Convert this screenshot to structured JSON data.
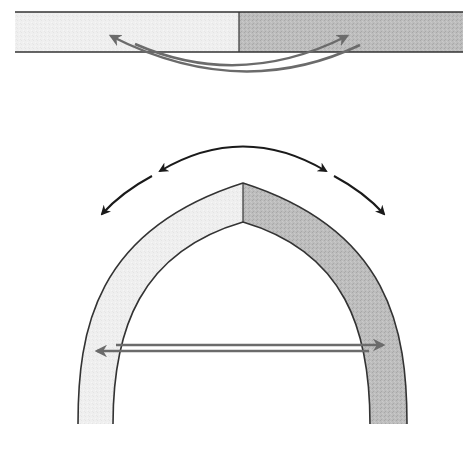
{
  "diagram": {
    "description": "Flat bilayer strip with two counter-directed curved arrows above; below, the same strip bent into an arch with outward-bending arrows on top and counter-directed horizontal arrows across the opening",
    "colors": {
      "light_segment": "#eeeeee",
      "dark_segment": "#b9b9b9",
      "outline": "#333333",
      "black_arrow": "#1a1a1a",
      "gray_arrow": "#6b6b6b",
      "background": "#ffffff"
    },
    "top_strip": {
      "label": "Flat strip",
      "segments": [
        "light",
        "dark"
      ],
      "arrows": [
        {
          "label": "arrow-to-left",
          "direction": "right-to-left"
        },
        {
          "label": "arrow-to-right",
          "direction": "left-to-right"
        }
      ]
    },
    "arch": {
      "label": "Bent arch",
      "segments": [
        "light",
        "dark"
      ],
      "top_arrows": [
        {
          "label": "outward-left",
          "direction": "counter-clockwise"
        },
        {
          "label": "outward-right",
          "direction": "clockwise"
        }
      ],
      "horizontal_arrows": [
        {
          "label": "pointing-right",
          "direction": "left-to-right"
        },
        {
          "label": "pointing-left",
          "direction": "right-to-left"
        }
      ]
    }
  }
}
